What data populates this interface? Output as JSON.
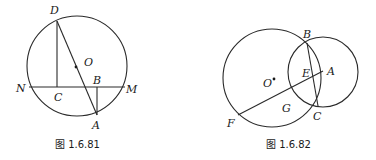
{
  "figures": [
    {
      "caption": "图 1.6.81",
      "circle": {
        "cx": 77,
        "cy": 66,
        "r": 50
      },
      "points": {
        "D": {
          "x": 57,
          "y": 21,
          "label": "D"
        },
        "O": {
          "x": 76,
          "y": 67,
          "label": "O"
        },
        "N": {
          "x": 29,
          "y": 87,
          "label": "N"
        },
        "M": {
          "x": 125,
          "y": 87,
          "label": "M"
        },
        "C": {
          "x": 57,
          "y": 87,
          "label": "C"
        },
        "B": {
          "x": 97,
          "y": 87,
          "label": "B"
        },
        "A": {
          "x": 97,
          "y": 115,
          "label": "A"
        }
      },
      "segments": [
        [
          "N",
          "M"
        ],
        [
          "D",
          "C"
        ],
        [
          "D",
          "A"
        ],
        [
          "B",
          "A"
        ]
      ]
    },
    {
      "caption": "图 1.6.82",
      "big_circle": {
        "cx": 272,
        "cy": 78,
        "r": 49
      },
      "small_circle": {
        "cx": 323,
        "cy": 72,
        "r": 35
      },
      "points": {
        "B": {
          "x": 307,
          "y": 43,
          "label": "B"
        },
        "C": {
          "x": 318,
          "y": 106,
          "label": "C"
        },
        "A": {
          "x": 323,
          "y": 71,
          "label": "A"
        },
        "E": {
          "x": 312,
          "y": 78,
          "label": "E"
        },
        "O": {
          "x": 274,
          "y": 79,
          "label": "O"
        },
        "F": {
          "x": 238,
          "y": 115,
          "label": "F"
        },
        "G": {
          "x": 285,
          "y": 101,
          "label": "G"
        }
      },
      "segments": [
        [
          "B",
          "C"
        ],
        [
          "F",
          "A"
        ]
      ]
    }
  ]
}
